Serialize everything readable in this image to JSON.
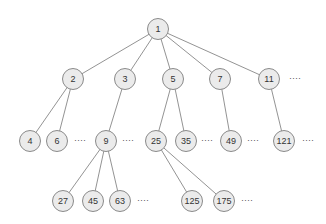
{
  "diagram": {
    "type": "tree",
    "node_style": {
      "fill": "#ebebeb",
      "stroke": "#8a8a8a",
      "edge": "#777777",
      "radius": 11
    },
    "nodes": [
      {
        "id": "n1",
        "label": "1",
        "x": 158,
        "y": 29
      },
      {
        "id": "n2",
        "label": "2",
        "x": 73,
        "y": 79
      },
      {
        "id": "n3",
        "label": "3",
        "x": 125,
        "y": 79
      },
      {
        "id": "n5",
        "label": "5",
        "x": 173,
        "y": 79
      },
      {
        "id": "n7",
        "label": "7",
        "x": 220,
        "y": 79
      },
      {
        "id": "n11",
        "label": "11",
        "x": 269,
        "y": 79
      },
      {
        "id": "n4",
        "label": "4",
        "x": 30,
        "y": 141
      },
      {
        "id": "n6",
        "label": "6",
        "x": 57,
        "y": 141
      },
      {
        "id": "n9",
        "label": "9",
        "x": 106,
        "y": 141
      },
      {
        "id": "n25",
        "label": "25",
        "x": 156,
        "y": 141
      },
      {
        "id": "n35",
        "label": "35",
        "x": 186,
        "y": 141
      },
      {
        "id": "n49",
        "label": "49",
        "x": 231,
        "y": 141
      },
      {
        "id": "n121",
        "label": "121",
        "x": 284,
        "y": 141
      },
      {
        "id": "n27",
        "label": "27",
        "x": 63,
        "y": 201
      },
      {
        "id": "n45",
        "label": "45",
        "x": 93,
        "y": 201
      },
      {
        "id": "n63",
        "label": "63",
        "x": 120,
        "y": 201
      },
      {
        "id": "n125",
        "label": "125",
        "x": 192,
        "y": 201
      },
      {
        "id": "n175",
        "label": "175",
        "x": 224,
        "y": 201
      }
    ],
    "edges": [
      [
        "n1",
        "n2"
      ],
      [
        "n1",
        "n3"
      ],
      [
        "n1",
        "n5"
      ],
      [
        "n1",
        "n7"
      ],
      [
        "n1",
        "n11"
      ],
      [
        "n2",
        "n4"
      ],
      [
        "n2",
        "n6"
      ],
      [
        "n3",
        "n9"
      ],
      [
        "n5",
        "n25"
      ],
      [
        "n5",
        "n35"
      ],
      [
        "n7",
        "n49"
      ],
      [
        "n11",
        "n121"
      ],
      [
        "n9",
        "n27"
      ],
      [
        "n9",
        "n45"
      ],
      [
        "n9",
        "n63"
      ],
      [
        "n25",
        "n125"
      ],
      [
        "n25",
        "n175"
      ]
    ],
    "ellipses": [
      {
        "id": "e-l2",
        "text": "····",
        "x": 295,
        "y": 79
      },
      {
        "id": "e-6",
        "text": "····",
        "x": 80,
        "y": 141
      },
      {
        "id": "e-9",
        "text": "····",
        "x": 128,
        "y": 141
      },
      {
        "id": "e-35",
        "text": "····",
        "x": 207,
        "y": 141
      },
      {
        "id": "e-49",
        "text": "····",
        "x": 253,
        "y": 141
      },
      {
        "id": "e-121",
        "text": "····",
        "x": 308,
        "y": 141
      },
      {
        "id": "e-63",
        "text": "····",
        "x": 143,
        "y": 201
      },
      {
        "id": "e-175",
        "text": "····",
        "x": 247,
        "y": 201
      }
    ]
  }
}
